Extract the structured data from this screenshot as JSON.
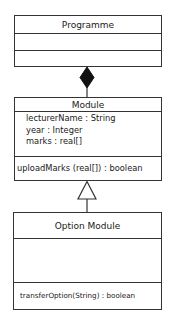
{
  "diagram": {
    "type": "uml-class-diagram",
    "classes": [
      {
        "name": "Programme",
        "attributes": [],
        "operations": []
      },
      {
        "name": "Module",
        "attributes": [
          "lecturerName : String",
          "year : Integer",
          "marks : real[]"
        ],
        "operations": [
          "uploadMarks (real[]) : boolean"
        ]
      },
      {
        "name": "Option Module",
        "attributes": [],
        "operations": [
          "transferOption(String) :  boolean"
        ]
      }
    ],
    "relationships": [
      {
        "type": "composition",
        "whole": "Programme",
        "part": "Module",
        "icon": "filled-diamond"
      },
      {
        "type": "generalization",
        "parent": "Module",
        "child": "Option Module",
        "icon": "hollow-triangle"
      }
    ],
    "colors": {
      "line": "#333333",
      "background": "#ffffff",
      "text": "#1a1a1a"
    }
  }
}
